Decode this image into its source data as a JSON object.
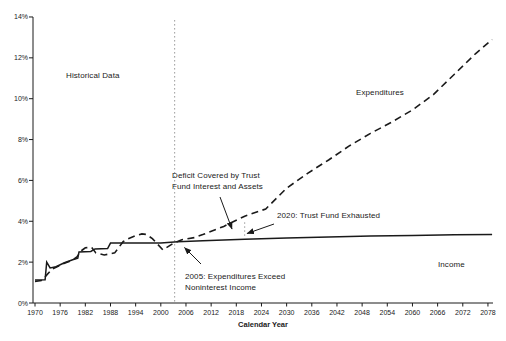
{
  "colors": {
    "line": "#1a1a1a",
    "text": "#1a1a1a",
    "dotted_guide": "#999999",
    "background": "#ffffff"
  },
  "labels": {
    "historical": "Historical Data",
    "expenditures": "Expenditures",
    "income": "Income",
    "deficit_line1": "Deficit Covered by Trust",
    "deficit_line2": "Fund Interest and Assets",
    "exhausted": "2020: Trust Fund Exhausted",
    "exceed_line1": "2005: Expenditures Exceed",
    "exceed_line2": "Noninterest Income",
    "xaxis_title": "Calendar Year"
  },
  "chart_data": {
    "type": "line",
    "title": "",
    "xlabel": "Calendar Year",
    "ylabel": "",
    "xlim": [
      1969.5,
      2080.5
    ],
    "ylim": [
      0,
      14
    ],
    "grid": false,
    "legend": "inline-labels",
    "x_tick_years": [
      1970,
      1976,
      1982,
      1988,
      1994,
      2000,
      2006,
      2012,
      2018,
      2024,
      2030,
      2036,
      2042,
      2048,
      2054,
      2060,
      2066,
      2072,
      2078
    ],
    "y_tick_labels": [
      "0%",
      "2%",
      "4%",
      "6%",
      "8%",
      "10%",
      "12%",
      "14%"
    ],
    "series": [
      {
        "name": "Expenditures",
        "line_style": "dashed",
        "points": [
          [
            1970,
            1.05
          ],
          [
            1971.5,
            1.1
          ],
          [
            1972.5,
            1.3
          ],
          [
            1974,
            1.65
          ],
          [
            1975,
            1.75
          ],
          [
            1977,
            1.95
          ],
          [
            1979,
            2.1
          ],
          [
            1980,
            2.25
          ],
          [
            1981,
            2.55
          ],
          [
            1982,
            2.7
          ],
          [
            1983.5,
            2.72
          ],
          [
            1984.5,
            2.45
          ],
          [
            1986.5,
            2.35
          ],
          [
            1989,
            2.45
          ],
          [
            1991,
            3.0
          ],
          [
            1992,
            3.13
          ],
          [
            1994,
            3.3
          ],
          [
            1995.5,
            3.38
          ],
          [
            1996.5,
            3.36
          ],
          [
            1998,
            3.15
          ],
          [
            2000.5,
            2.6
          ],
          [
            2003,
            2.92
          ],
          [
            2005,
            3.1
          ],
          [
            2008,
            3.2
          ],
          [
            2010,
            3.35
          ],
          [
            2015,
            3.75
          ],
          [
            2020,
            4.25
          ],
          [
            2025,
            4.6
          ],
          [
            2030,
            5.62
          ],
          [
            2035,
            6.35
          ],
          [
            2040,
            7.0
          ],
          [
            2045,
            7.7
          ],
          [
            2050,
            8.3
          ],
          [
            2055,
            8.85
          ],
          [
            2060,
            9.45
          ],
          [
            2065,
            10.2
          ],
          [
            2070,
            11.2
          ],
          [
            2075,
            12.2
          ],
          [
            2079,
            12.9
          ]
        ]
      },
      {
        "name": "Income",
        "line_style": "solid",
        "points": [
          [
            1970,
            1.13
          ],
          [
            1972.4,
            1.14
          ],
          [
            1972.8,
            2.0
          ],
          [
            1973.6,
            1.72
          ],
          [
            1975,
            1.77
          ],
          [
            1977,
            1.97
          ],
          [
            1979,
            2.12
          ],
          [
            1980.2,
            2.2
          ],
          [
            1980.5,
            2.5
          ],
          [
            1983.3,
            2.52
          ],
          [
            1984.3,
            2.65
          ],
          [
            1987.3,
            2.67
          ],
          [
            1988,
            2.93
          ],
          [
            1995,
            2.93
          ],
          [
            2000,
            2.93
          ],
          [
            2004,
            3.0
          ],
          [
            2010,
            3.05
          ],
          [
            2020,
            3.12
          ],
          [
            2030,
            3.18
          ],
          [
            2040,
            3.23
          ],
          [
            2050,
            3.28
          ],
          [
            2060,
            3.31
          ],
          [
            2070,
            3.34
          ],
          [
            2079,
            3.36
          ]
        ]
      }
    ],
    "guides": {
      "historical_boundary": {
        "year": 2003.3,
        "v_from": 0,
        "v_to": 13.85
      },
      "exhaustion_marker": {
        "year": 2020,
        "v_from": 3.2,
        "v_to": 3.95
      }
    },
    "arrows": [
      {
        "name": "deficit-arrow",
        "x1": 220,
        "y1": 197,
        "x2": 232,
        "y2": 229
      },
      {
        "name": "exhausted-arrow",
        "x1": 274,
        "y1": 224,
        "x2": 247,
        "y2": 233.5
      },
      {
        "name": "exceed-arrow",
        "x1": 201,
        "y1": 264,
        "x2": 184.5,
        "y2": 247.5
      }
    ]
  }
}
